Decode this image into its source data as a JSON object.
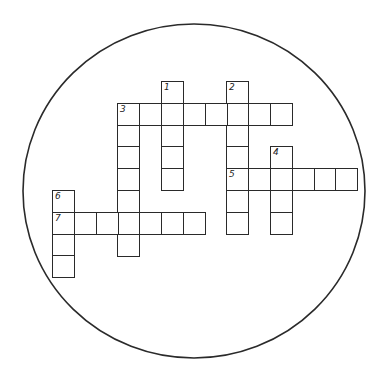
{
  "puzzle": {
    "type": "crossword",
    "frame": "circle",
    "colors": {
      "ink": "#2a2a2a",
      "background": "#ffffff"
    },
    "entries": [
      {
        "number": "1",
        "direction": "down",
        "row": 0,
        "col": 5,
        "length": 5
      },
      {
        "number": "2",
        "direction": "down",
        "row": 0,
        "col": 8,
        "length": 7
      },
      {
        "number": "3",
        "direction": "across",
        "row": 1,
        "col": 3,
        "length": 8
      },
      {
        "number": "3",
        "direction": "down",
        "row": 1,
        "col": 3,
        "length": 7
      },
      {
        "number": "4",
        "direction": "down",
        "row": 3,
        "col": 10,
        "length": 4
      },
      {
        "number": "5",
        "direction": "across",
        "row": 4,
        "col": 8,
        "length": 6
      },
      {
        "number": "6",
        "direction": "down",
        "row": 5,
        "col": 0,
        "length": 4
      },
      {
        "number": "7",
        "direction": "across",
        "row": 6,
        "col": 0,
        "length": 7
      }
    ],
    "labels": [
      {
        "number": "1",
        "row": 0,
        "col": 5
      },
      {
        "number": "2",
        "row": 0,
        "col": 8
      },
      {
        "number": "3",
        "row": 1,
        "col": 3
      },
      {
        "number": "4",
        "row": 3,
        "col": 10
      },
      {
        "number": "5",
        "row": 4,
        "col": 8
      },
      {
        "number": "6",
        "row": 5,
        "col": 0
      },
      {
        "number": "7",
        "row": 6,
        "col": 0
      }
    ]
  }
}
